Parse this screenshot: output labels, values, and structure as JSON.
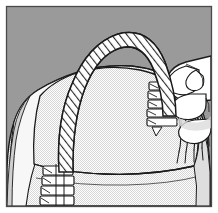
{
  "figure": {
    "title": "Hand weaving a wicker basket with a twisted rope handle",
    "style": "black-and-white line art with halftone stipple shading"
  },
  "canvas": {
    "width": 218,
    "height": 213,
    "background_color": "#9a9a9a",
    "paper_color": "#ffffff"
  },
  "frame": {
    "name": "image-border",
    "stroke_color": "#4a4a4a",
    "stroke_width": 1,
    "inset": 6
  },
  "colors": {
    "background_gray": "#9a9a9a",
    "basket_fill": "#f2f2f2",
    "basket_stipple": "#d8d8d8",
    "handle_fill": "#ffffff",
    "hand_fill": "#ffffff",
    "line_color": "#1a1a1a",
    "shadow_gray": "#b8b8b8"
  },
  "elements": [
    {
      "id": "background",
      "name": "background-field",
      "label": "Flat gray background field",
      "fill": "#9a9a9a"
    },
    {
      "id": "basket_body",
      "name": "basket-body",
      "label": "Woven basket body",
      "description": "Large rounded basket form occupying the lower two thirds of the frame, filled with a fine halftone stipple texture",
      "fill": "#f2f2f2"
    },
    {
      "id": "basket_rim",
      "name": "basket-rim",
      "label": "Basket rim line",
      "description": "Curved horizontal contour across the upper basket indicating the rim edge"
    },
    {
      "id": "basket_lower_band",
      "name": "basket-lower-band",
      "label": "Lower basket band",
      "description": "Second contour line across the basket near the bottom marking a woven band"
    },
    {
      "id": "handle",
      "name": "rope-handle",
      "label": "Twisted rope handle",
      "description": "Thick arched handle rising from lower left across the top to the right rim, drawn white with diagonal hatch strokes to indicate twisted cord",
      "fill": "#ffffff",
      "hatch": "diagonal"
    },
    {
      "id": "lashing_left",
      "name": "handle-lashing-left",
      "label": "Left handle lashing",
      "description": "Stack of horizontal binding wraps securing the handle to the basket at the lower left"
    },
    {
      "id": "lashing_right",
      "name": "handle-lashing-right",
      "label": "Right handle lashing",
      "description": "Stack of horizontal binding wraps securing the handle to the basket at the right rim"
    },
    {
      "id": "strands",
      "name": "weaving-strands",
      "label": "Loose weaving strands",
      "description": "Bundle of long thin flexible strands sweeping down and right from the lashing point, held by the hand"
    },
    {
      "id": "hand",
      "name": "weaver-hand",
      "label": "Weaver's hand",
      "description": "Hand entering from the right edge of the frame, fingers curled around the strand bundle"
    }
  ],
  "legend": {
    "visible": false,
    "items": []
  },
  "annotations": {
    "visible": false,
    "items": []
  }
}
